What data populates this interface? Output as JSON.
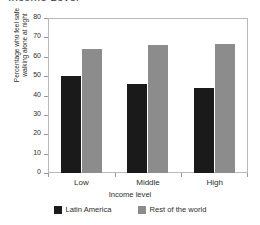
{
  "chart_data": {
    "type": "bar",
    "title": "Income Level",
    "xlabel": "Income level",
    "ylabel": "Percentage who feel safe walking alone at night",
    "ylabel_line1": "Percentage who feel safe",
    "ylabel_line2": "walking alone at night",
    "categories": [
      "Low",
      "Middle",
      "High"
    ],
    "series": [
      {
        "name": "Latin America",
        "color": "#1a1a1a",
        "values": [
          50,
          46,
          44
        ]
      },
      {
        "name": "Rest of the world",
        "color": "#8c8c8c",
        "values": [
          64,
          66,
          66.5
        ]
      }
    ],
    "ylim": [
      0,
      80
    ],
    "ytick_step": 10,
    "yticks": [
      0,
      10,
      20,
      30,
      40,
      50,
      60,
      70,
      80
    ],
    "grid": false,
    "legend_position": "bottom",
    "frame": true
  }
}
